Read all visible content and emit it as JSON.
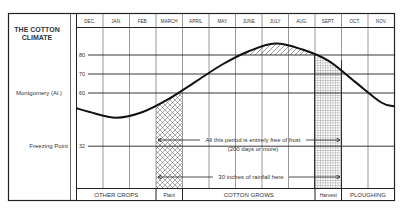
{
  "title_lines": [
    "THE COTTON",
    "CLIMATE"
  ],
  "side_labels": {
    "location": "Montgomery (Al.)",
    "freezing": "Freezing Point"
  },
  "chart_data": {
    "type": "line",
    "subtitle": "Montgomery (Al.)",
    "xlabel": "",
    "ylabel": "Temperature (°F)",
    "categories": [
      "DEC.",
      "JAN.",
      "FEB.",
      "MARCH",
      "APRIL",
      "MAY",
      "JUNE",
      "JULY",
      "AUG.",
      "SEPT.",
      "OCT.",
      "NOV."
    ],
    "y_ticks": [
      32,
      60,
      70,
      80
    ],
    "ylim": [
      20,
      90
    ],
    "grid": true,
    "series": [
      {
        "name": "Mean temperature, Montgomery (Al.)",
        "values": [
          50,
          47,
          50,
          57,
          66,
          75,
          82,
          86,
          83,
          77,
          66,
          55
        ]
      }
    ],
    "shaded_regions": [
      {
        "label": "Plant",
        "months": [
          "MARCH"
        ],
        "pattern": "cross-hatch"
      },
      {
        "label": "Above 80°F",
        "months": [
          "JUNE",
          "JULY",
          "AUG."
        ],
        "pattern": "diagonal"
      },
      {
        "label": "Harvest",
        "months": [
          "SEPT."
        ],
        "pattern": "grid"
      }
    ],
    "annotations": [
      "All this period is entirely free of frost (200 days or more)",
      "30 inches of rainfall here"
    ],
    "phases": [
      {
        "label": "OTHER CROPS",
        "months": [
          "DEC.",
          "JAN.",
          "FEB."
        ]
      },
      {
        "label": "Plant",
        "months": [
          "MARCH"
        ]
      },
      {
        "label": "COTTON GROWS",
        "months": [
          "APRIL",
          "MAY",
          "JUNE",
          "JULY",
          "AUG."
        ]
      },
      {
        "label": "Harvest",
        "months": [
          "SEPT."
        ]
      },
      {
        "label": "PLOUGHING",
        "months": [
          "OCT.",
          "NOV."
        ]
      }
    ],
    "legend": null
  }
}
